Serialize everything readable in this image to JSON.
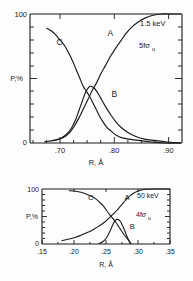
{
  "figure": {
    "title": "",
    "background_color": "#fdfdfd",
    "ink_color": "#1a1a1a"
  },
  "chart_data": [
    {
      "type": "line",
      "title": "",
      "panel_id": "upper",
      "xlabel": "R, Å",
      "ylabel": "P,%",
      "xlim": [
        0.645,
        0.925
      ],
      "ylim": [
        0,
        100
      ],
      "xticks": [
        0.7,
        0.8,
        0.9
      ],
      "xticklabels": [
        ".70",
        ".80",
        ".90"
      ],
      "yticks": [
        0,
        100
      ],
      "yticklabels": [
        "0",
        "100"
      ],
      "y_minor_tick_count": 9,
      "x_minor_tick_count": 4,
      "grid": false,
      "legend": "inline-curve-labels",
      "annotations": [
        {
          "text": "1.5  keV",
          "x": 0.862,
          "y": 88
        },
        {
          "text": "5fσ",
          "subscript": "u",
          "x": 0.858,
          "y": 66
        }
      ],
      "series": [
        {
          "name": "A",
          "label_x": 0.788,
          "label_y": 83,
          "x": [
            0.672,
            0.69,
            0.706,
            0.718,
            0.728,
            0.737,
            0.745,
            0.752,
            0.76,
            0.768,
            0.776,
            0.784,
            0.793,
            0.802,
            0.812,
            0.822,
            0.833,
            0.845,
            0.858,
            0.872,
            0.888,
            0.905,
            0.922
          ],
          "y": [
            1,
            2,
            4,
            8,
            14,
            21,
            28,
            34,
            41,
            47,
            54,
            60,
            67,
            73,
            79,
            85,
            90,
            94,
            97,
            99,
            100,
            100,
            100
          ]
        },
        {
          "name": "B",
          "label_x": 0.795,
          "label_y": 36,
          "x": [
            0.688,
            0.698,
            0.707,
            0.715,
            0.722,
            0.729,
            0.735,
            0.741,
            0.746,
            0.751,
            0.756,
            0.762,
            0.768,
            0.775,
            0.783,
            0.792,
            0.802,
            0.813,
            0.826,
            0.84,
            0.856,
            0.874,
            0.895,
            0.922
          ],
          "y": [
            2,
            3,
            5,
            8,
            12,
            18,
            25,
            32,
            38,
            42,
            44,
            43,
            40,
            35,
            29,
            23,
            17,
            12,
            8,
            5,
            3,
            2,
            1,
            0
          ]
        },
        {
          "name": "C",
          "label_x": 0.694,
          "label_y": 76,
          "x": [
            0.676,
            0.684,
            0.692,
            0.7,
            0.708,
            0.716,
            0.723,
            0.73,
            0.737,
            0.743,
            0.749,
            0.755,
            0.761,
            0.767,
            0.773,
            0.78,
            0.787,
            0.795,
            0.804,
            0.815,
            0.828,
            0.845,
            0.866,
            0.892,
            0.922
          ],
          "y": [
            89,
            87,
            84,
            80,
            76,
            70,
            64,
            57,
            50,
            44,
            40,
            36,
            31,
            26,
            21,
            16,
            12,
            9,
            6,
            4,
            3,
            2,
            1,
            0,
            0
          ]
        }
      ]
    },
    {
      "type": "line",
      "title": "",
      "panel_id": "lower",
      "xlabel": "R, Å",
      "ylabel": "P,%",
      "xlim": [
        0.15,
        0.35
      ],
      "ylim": [
        0,
        100
      ],
      "xticks": [
        0.15,
        0.2,
        0.25,
        0.3,
        0.35
      ],
      "xticklabels": [
        ".15",
        ".20",
        ".25",
        ".30",
        ".35"
      ],
      "yticks": [
        0,
        100
      ],
      "yticklabels": [
        "0",
        "100"
      ],
      "y_minor_tick_count": 9,
      "x_minor_tick_count": 4,
      "grid": false,
      "legend": "inline-curve-labels",
      "annotations": [
        {
          "text": "50  keV",
          "x": 0.307,
          "y": 90
        },
        {
          "text": "4fσ",
          "subscript": "u",
          "x": 0.303,
          "y": 64
        }
      ],
      "series": [
        {
          "name": "A",
          "label_x": 0.279,
          "label_y": 80,
          "x": [
            0.181,
            0.192,
            0.202,
            0.211,
            0.219,
            0.227,
            0.234,
            0.241,
            0.248,
            0.254,
            0.26,
            0.266,
            0.272,
            0.278,
            0.284,
            0.291,
            0.299,
            0.309,
            0.322,
            0.336,
            0.35
          ],
          "y": [
            6,
            9,
            12,
            16,
            20,
            24,
            29,
            34,
            40,
            46,
            53,
            60,
            68,
            76,
            84,
            91,
            96,
            99,
            100,
            100,
            100
          ]
        },
        {
          "name": "B",
          "label_x": 0.287,
          "label_y": 27,
          "x": [
            0.239,
            0.245,
            0.25,
            0.254,
            0.258,
            0.261,
            0.264,
            0.267,
            0.27,
            0.273,
            0.276,
            0.279,
            0.282,
            0.285,
            0.288
          ],
          "y": [
            1,
            4,
            10,
            18,
            28,
            36,
            42,
            45,
            44,
            40,
            33,
            25,
            16,
            8,
            1
          ]
        },
        {
          "name": "C",
          "label_x": 0.222,
          "label_y": 80,
          "x": [
            0.193,
            0.202,
            0.211,
            0.219,
            0.227,
            0.234,
            0.24,
            0.246,
            0.251,
            0.256,
            0.261,
            0.265,
            0.269,
            0.273,
            0.277,
            0.281,
            0.285,
            0.289
          ],
          "y": [
            97,
            96,
            94,
            91,
            87,
            82,
            76,
            69,
            61,
            53,
            46,
            40,
            33,
            26,
            19,
            13,
            7,
            1
          ]
        }
      ]
    }
  ]
}
